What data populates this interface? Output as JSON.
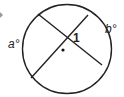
{
  "diagram": {
    "type": "circle-intersecting-chords",
    "labels": {
      "arc_left": "a°",
      "arc_right": "b°",
      "angle": "1"
    },
    "colors": {
      "stroke": "#222222",
      "marker": "#9a9a9a"
    }
  }
}
